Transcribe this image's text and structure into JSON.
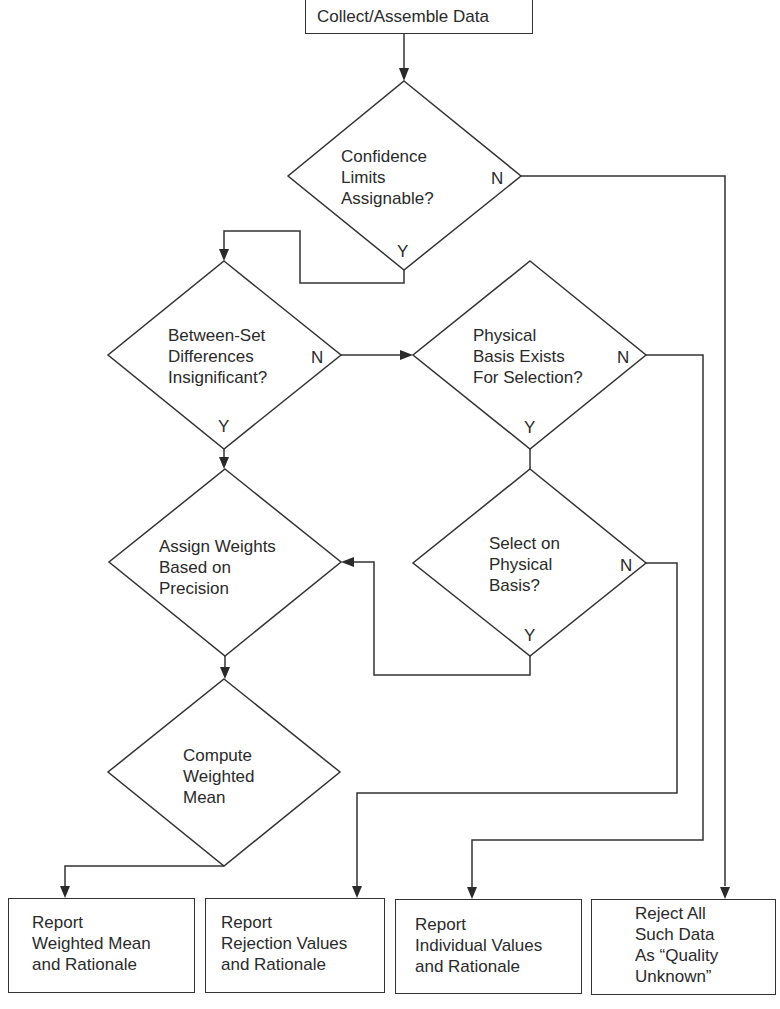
{
  "diagram": {
    "type": "flowchart",
    "start": {
      "label": "Collect/Assemble Data"
    },
    "decisions": [
      {
        "id": "d1",
        "label": "Confidence\nLimits\nAssignable?",
        "yes": "Y",
        "no": "N"
      },
      {
        "id": "d2",
        "label": "Between-Set\nDifferences\nInsignificant?",
        "yes": "Y",
        "no": "N"
      },
      {
        "id": "d3",
        "label": "Physical\nBasis Exists\nFor Selection?",
        "yes": "Y",
        "no": "N"
      },
      {
        "id": "d4",
        "label": "Select on\nPhysical\nBasis?",
        "yes": "Y",
        "no": "N"
      },
      {
        "id": "d5",
        "label": "Assign Weights\nBased on\nPrecision"
      },
      {
        "id": "d6",
        "label": "Compute\nWeighted\nMean"
      }
    ],
    "outcomes": [
      {
        "id": "o1",
        "label": "Report\nWeighted Mean\nand Rationale"
      },
      {
        "id": "o2",
        "label": "Report\nRejection Values\nand Rationale"
      },
      {
        "id": "o3",
        "label": "Report\nIndividual Values\nand Rationale"
      },
      {
        "id": "o4",
        "label": "Reject All\nSuch Data\nAs “Quality\nUnknown”"
      }
    ]
  }
}
